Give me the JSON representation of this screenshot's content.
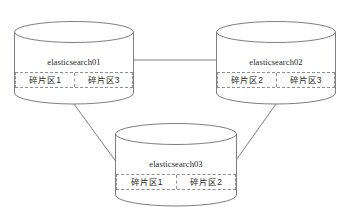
{
  "diagram": {
    "type": "cluster-topology",
    "background_color": "#ffffff",
    "stroke_color": "#6f6f77",
    "dashed_stroke_color": "#8d8d93",
    "text_color": "#25252a",
    "nodes": [
      {
        "id": "elasticsearch01",
        "label": "elasticsearch01",
        "shape": "cylinder",
        "x": 14,
        "y": 21,
        "width": 120,
        "height": 83,
        "ellipse_ry": 11,
        "shard_strip": {
          "top": 51,
          "height": 16
        },
        "shards": [
          {
            "label": "碎片区1"
          },
          {
            "label": "碎片区3"
          }
        ]
      },
      {
        "id": "elasticsearch02",
        "label": "elasticsearch02",
        "shape": "cylinder",
        "x": 216,
        "y": 21,
        "width": 120,
        "height": 83,
        "ellipse_ry": 11,
        "shard_strip": {
          "top": 51,
          "height": 16
        },
        "shards": [
          {
            "label": "碎片区2"
          },
          {
            "label": "碎片区3"
          }
        ]
      },
      {
        "id": "elasticsearch03",
        "label": "elasticsearch03",
        "shape": "cylinder",
        "x": 115,
        "y": 123,
        "width": 122,
        "height": 83,
        "ellipse_ry": 11,
        "shard_strip": {
          "top": 51,
          "height": 16
        },
        "shards": [
          {
            "label": "碎片区1"
          },
          {
            "label": "碎片区2"
          }
        ]
      }
    ],
    "edges": [
      {
        "id": "edge-es01-es02",
        "from": "elasticsearch01",
        "to": "elasticsearch02",
        "x1": 134,
        "y1": 60,
        "x2": 216,
        "y2": 60
      },
      {
        "id": "edge-es01-es03",
        "from": "elasticsearch01",
        "to": "elasticsearch03",
        "x1": 74,
        "y1": 104,
        "x2": 117,
        "y2": 163
      },
      {
        "id": "edge-es02-es03",
        "from": "elasticsearch02",
        "to": "elasticsearch03",
        "x1": 276,
        "y1": 104,
        "x2": 234,
        "y2": 163
      }
    ]
  }
}
